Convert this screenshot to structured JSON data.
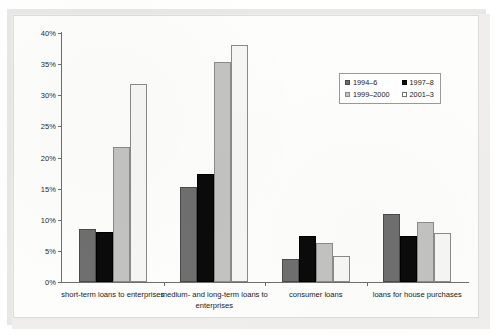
{
  "chart_data": {
    "type": "bar",
    "title": "",
    "xlabel": "",
    "ylabel": "",
    "ylim": [
      0,
      40
    ],
    "ytick_labels": [
      "0%",
      "5%",
      "10%",
      "15%",
      "20%",
      "25%",
      "30%",
      "35%",
      "40%"
    ],
    "ytick_values": [
      0,
      5,
      10,
      15,
      20,
      25,
      30,
      35,
      40
    ],
    "grid": false,
    "legend_position": "upper right",
    "categories": [
      "short-term loans to enterprises",
      "medium- and long-term loans to enterprises",
      "consumer loans",
      "loans for house purchases"
    ],
    "series": [
      {
        "name": "1994–6",
        "color": "#6f6f6f",
        "values": [
          8.5,
          15.2,
          3.7,
          10.9
        ]
      },
      {
        "name": "1997–8",
        "color": "#0b0b0b",
        "values": [
          8.1,
          17.3,
          7.4,
          7.4
        ]
      },
      {
        "name": "1999–2000",
        "color": "#c3c3c1",
        "values": [
          21.7,
          35.4,
          6.3,
          9.6
        ]
      },
      {
        "name": "2001–3",
        "color": "#f6f6f4",
        "values": [
          31.8,
          38.0,
          4.2,
          7.9
        ]
      }
    ]
  },
  "legend": {
    "items": [
      {
        "label": "1994–6"
      },
      {
        "label": "1997–8"
      },
      {
        "label": "1999–2000"
      },
      {
        "label": "2001–3"
      }
    ]
  }
}
